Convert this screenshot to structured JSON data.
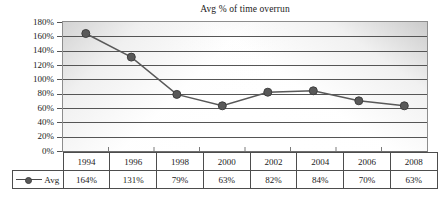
{
  "chart_data": {
    "type": "line",
    "title": "Avg % of time overrun",
    "xlabel": "",
    "ylabel": "",
    "categories": [
      "1994",
      "1996",
      "1998",
      "2000",
      "2002",
      "2004",
      "2006",
      "2008"
    ],
    "series": [
      {
        "name": "Avg",
        "values": [
          164,
          131,
          79,
          63,
          82,
          84,
          70,
          63
        ],
        "labels": [
          "164%",
          "131%",
          "79%",
          "63%",
          "82%",
          "84%",
          "70%",
          "63%"
        ],
        "marker": "filled-circle",
        "color": "#595959"
      }
    ],
    "ylim": [
      0,
      180
    ],
    "ytick_step": 20,
    "ytick_labels": [
      "180%",
      "160%",
      "140%",
      "120%",
      "100%",
      "80%",
      "60%",
      "40%",
      "20%",
      "0%"
    ],
    "grid": true,
    "legend_position": "row-header-left",
    "legend_entries": [
      "Avg"
    ]
  },
  "table": {
    "header_row": [
      "1994",
      "1996",
      "1998",
      "2000",
      "2002",
      "2004",
      "2006",
      "2008"
    ],
    "data_row_label": "Avg",
    "data_row": [
      "164%",
      "131%",
      "79%",
      "63%",
      "82%",
      "84%",
      "70%",
      "63%"
    ]
  },
  "colors": {
    "series": "#595959",
    "gridline": "#555555",
    "border": "#4d4d4d",
    "text": "#1b1b1b"
  }
}
